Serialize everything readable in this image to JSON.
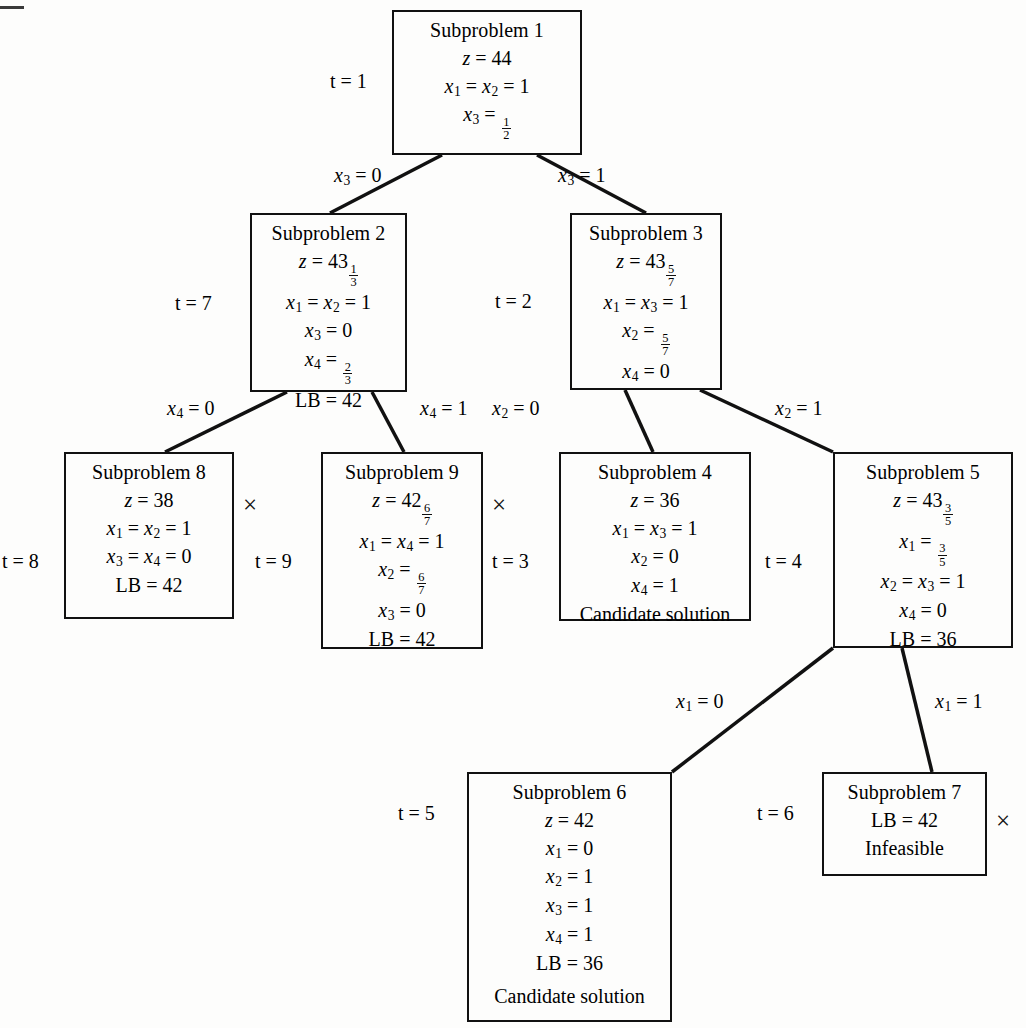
{
  "figure": {
    "type": "branch-and-bound-tree",
    "corner_mark": "dash"
  },
  "nodes": [
    {
      "id": "sub1",
      "title": "Subproblem 1",
      "t_label": "t = 1",
      "lines": [
        {
          "lhs": "z",
          "rhs": "44"
        },
        {
          "lhs": "x1 = x2",
          "rhs": "1"
        },
        {
          "lhs": "x3",
          "rhs": "1/2"
        }
      ],
      "note": "",
      "pruned": false
    },
    {
      "id": "sub2",
      "title": "Subproblem 2",
      "t_label": "t = 7",
      "lines": [
        {
          "lhs": "z",
          "rhs": "43 1/3"
        },
        {
          "lhs": "x1 = x2",
          "rhs": "1"
        },
        {
          "lhs": "x3",
          "rhs": "0"
        },
        {
          "lhs": "x4",
          "rhs": "2/3"
        },
        {
          "lhs": "LB",
          "rhs": "42"
        }
      ],
      "note": "",
      "pruned": false
    },
    {
      "id": "sub3",
      "title": "Subproblem 3",
      "t_label": "t = 2",
      "lines": [
        {
          "lhs": "z",
          "rhs": "43 5/7"
        },
        {
          "lhs": "x1 = x3",
          "rhs": "1"
        },
        {
          "lhs": "x2",
          "rhs": "5/7"
        },
        {
          "lhs": "x4",
          "rhs": "0"
        }
      ],
      "note": "",
      "pruned": false
    },
    {
      "id": "sub8",
      "title": "Subproblem 8",
      "t_label": "t = 8",
      "lines": [
        {
          "lhs": "z",
          "rhs": "38"
        },
        {
          "lhs": "x1 = x2",
          "rhs": "1"
        },
        {
          "lhs": "x3 = x4",
          "rhs": "0"
        },
        {
          "lhs": "LB",
          "rhs": "42"
        }
      ],
      "note": "",
      "pruned": true
    },
    {
      "id": "sub9",
      "title": "Subproblem 9",
      "t_label": "t = 9",
      "lines": [
        {
          "lhs": "z",
          "rhs": "42 6/7"
        },
        {
          "lhs": "x1 = x4",
          "rhs": "1"
        },
        {
          "lhs": "x2",
          "rhs": "6/7"
        },
        {
          "lhs": "x3",
          "rhs": "0"
        },
        {
          "lhs": "LB",
          "rhs": "42"
        }
      ],
      "note": "",
      "pruned": true
    },
    {
      "id": "sub4",
      "title": "Subproblem 4",
      "t_label": "t = 3",
      "lines": [
        {
          "lhs": "z",
          "rhs": "36"
        },
        {
          "lhs": "x1 = x3",
          "rhs": "1"
        },
        {
          "lhs": "x2",
          "rhs": "0"
        },
        {
          "lhs": "x4",
          "rhs": "1"
        }
      ],
      "note": "Candidate solution",
      "pruned": false
    },
    {
      "id": "sub5",
      "title": "Subproblem 5",
      "t_label": "t = 4",
      "lines": [
        {
          "lhs": "z",
          "rhs": "43 3/5"
        },
        {
          "lhs": "x1",
          "rhs": "3/5"
        },
        {
          "lhs": "x2 = x3",
          "rhs": "1"
        },
        {
          "lhs": "x4",
          "rhs": "0"
        },
        {
          "lhs": "LB",
          "rhs": "36"
        }
      ],
      "note": "",
      "pruned": false
    },
    {
      "id": "sub6",
      "title": "Subproblem 6",
      "t_label": "t = 5",
      "lines": [
        {
          "lhs": "z",
          "rhs": "42"
        },
        {
          "lhs": "x1",
          "rhs": "0"
        },
        {
          "lhs": "x2",
          "rhs": "1"
        },
        {
          "lhs": "x3",
          "rhs": "1"
        },
        {
          "lhs": "x4",
          "rhs": "1"
        },
        {
          "lhs": "LB",
          "rhs": "36"
        }
      ],
      "note": "Candidate solution",
      "pruned": false
    },
    {
      "id": "sub7",
      "title": "Subproblem 7",
      "t_label": "t = 6",
      "lines": [
        {
          "lhs": "LB",
          "rhs": "42"
        }
      ],
      "note": "Infeasible",
      "pruned": true
    }
  ],
  "edges": [
    {
      "from": "sub1",
      "to": "sub2",
      "label_var": "x3",
      "label_val": "0"
    },
    {
      "from": "sub1",
      "to": "sub3",
      "label_var": "x3",
      "label_val": "1"
    },
    {
      "from": "sub2",
      "to": "sub8",
      "label_var": "x4",
      "label_val": "0"
    },
    {
      "from": "sub2",
      "to": "sub9",
      "label_var": "x4",
      "label_val": "1"
    },
    {
      "from": "sub3",
      "to": "sub4",
      "label_var": "x2",
      "label_val": "0"
    },
    {
      "from": "sub3",
      "to": "sub5",
      "label_var": "x2",
      "label_val": "1"
    },
    {
      "from": "sub5",
      "to": "sub6",
      "label_var": "x1",
      "label_val": "0"
    },
    {
      "from": "sub5",
      "to": "sub7",
      "label_var": "x1",
      "label_val": "1"
    }
  ],
  "prune_symbol": "×"
}
